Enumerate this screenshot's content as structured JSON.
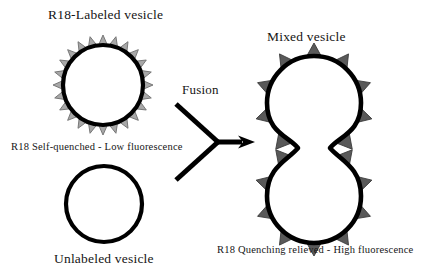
{
  "figure": {
    "type": "schematic-diagram",
    "background": "#ffffff"
  },
  "colors": {
    "outline": "#000000",
    "labeled_spike_fill": "#a8a8a8",
    "labeled_spike_stroke": "#6e6e6e",
    "mixed_spike_fill": "#595959",
    "mixed_spike_stroke": "#3a3a3a",
    "text": "#151515",
    "vesicle_interior": "#ffffff"
  },
  "labels": {
    "r18_labeled_vesicle": "R18-Labeled vesicle",
    "unlabeled_vesicle": "Unlabeled vesicle",
    "self_quenched": "R18 Self-quenched - Low fluorescence",
    "mixed_vesicle": "Mixed vesicle",
    "quenching_relieved": "R18 Quenching relieved - High fluorescence",
    "fusion": "Fusion"
  },
  "shapes": {
    "labeled_vesicle": {
      "name": "R18-Labeled vesicle",
      "kind": "spiked-circle",
      "center": [
        103,
        85
      ],
      "radius": 40,
      "spike_count": 24,
      "spike_height": 10,
      "spike_fill": "#a8a8a8",
      "ring_width": 4.2
    },
    "unlabeled_vesicle": {
      "name": "Unlabeled vesicle",
      "kind": "plain-circle",
      "center": [
        104,
        204
      ],
      "radius": 38,
      "spike_count": 0,
      "ring_width": 4.2
    },
    "mixed_vesicle": {
      "name": "Mixed vesicle",
      "kind": "spiked-dumbbell",
      "upper_center": [
        314,
        103
      ],
      "lower_center": [
        314,
        196
      ],
      "radius": 47,
      "waist_y": 148,
      "spike_count": 18,
      "spike_height": 13,
      "spike_fill": "#595959",
      "ring_width": 4.6
    },
    "fusion_arrow": {
      "name": "Fusion converging arrow",
      "kind": "y-arrow",
      "upper_tail": [
        176,
        104
      ],
      "lower_tail": [
        176,
        180
      ],
      "vertex": [
        218,
        142
      ],
      "head_tip": [
        255,
        142
      ],
      "stroke_width": 5
    }
  }
}
